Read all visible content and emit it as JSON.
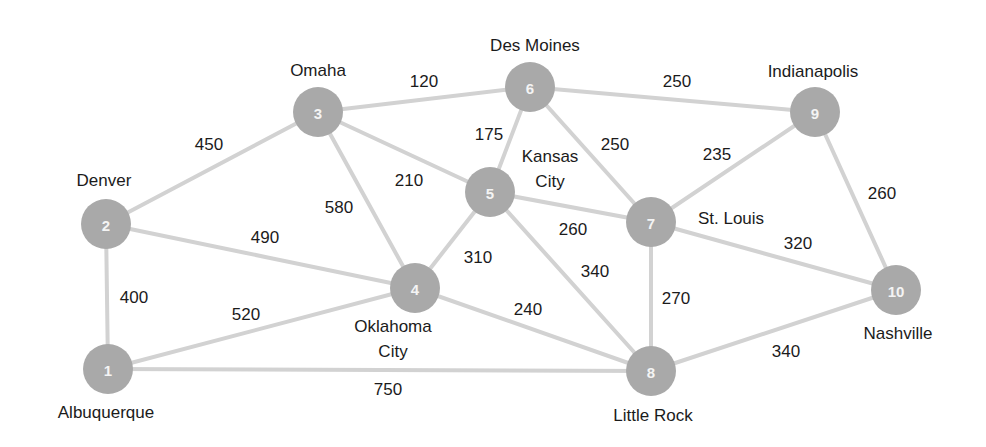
{
  "diagram": {
    "type": "weighted-undirected-graph",
    "colors": {
      "node_fill": "#a9a9a9",
      "node_number": "#f4f4f4",
      "edge": "#d2d2d2",
      "text": "#1b1b1b",
      "background": "#ffffff"
    },
    "nodes": [
      {
        "id": 1,
        "num": "1",
        "city": [
          "Albuquerque"
        ],
        "x": 108,
        "y": 369,
        "label_x": 106,
        "label_y": [
          418
        ]
      },
      {
        "id": 2,
        "num": "2",
        "city": [
          "Denver"
        ],
        "x": 106,
        "y": 224,
        "label_x": 104,
        "label_y": [
          186
        ]
      },
      {
        "id": 3,
        "num": "3",
        "city": [
          "Omaha"
        ],
        "x": 318,
        "y": 112,
        "label_x": 318,
        "label_y": 76
      },
      {
        "id": 4,
        "num": "4",
        "city": [
          "Oklahoma",
          "City"
        ],
        "x": 415,
        "y": 288,
        "label_x": 393,
        "label_y": [
          332,
          357
        ]
      },
      {
        "id": 5,
        "num": "5",
        "city": [
          "Kansas",
          "City"
        ],
        "x": 490,
        "y": 192,
        "label_x": 550,
        "label_y": [
          162,
          187
        ]
      },
      {
        "id": 6,
        "num": "6",
        "city": [
          "Des Moines"
        ],
        "x": 530,
        "y": 87,
        "label_x": 535,
        "label_y": [
          51
        ]
      },
      {
        "id": 7,
        "num": "7",
        "city": [
          "St. Louis"
        ],
        "x": 651,
        "y": 222,
        "label_x": 731,
        "label_y": [
          224
        ]
      },
      {
        "id": 8,
        "num": "8",
        "city": [
          "Little Rock"
        ],
        "x": 651,
        "y": 371,
        "label_x": 653,
        "label_y": [
          421
        ]
      },
      {
        "id": 9,
        "num": "9",
        "city": [
          "Indianapolis"
        ],
        "x": 815,
        "y": 112,
        "label_x": 813,
        "label_y": [
          77
        ]
      },
      {
        "id": 10,
        "num": "10",
        "city": [
          "Nashville"
        ],
        "x": 896,
        "y": 290,
        "label_x": 898,
        "label_y": [
          339
        ]
      }
    ],
    "node_radius": 25,
    "edges": [
      {
        "from": 1,
        "to": 2,
        "weight": "400",
        "lx": 134,
        "ly": 303
      },
      {
        "from": 1,
        "to": 4,
        "weight": "520",
        "lx": 246,
        "ly": 320
      },
      {
        "from": 1,
        "to": 8,
        "weight": "750",
        "lx": 388,
        "ly": 395
      },
      {
        "from": 2,
        "to": 3,
        "weight": "450",
        "lx": 209,
        "ly": 150
      },
      {
        "from": 2,
        "to": 4,
        "weight": "490",
        "lx": 265,
        "ly": 243
      },
      {
        "from": 3,
        "to": 4,
        "weight": "580",
        "lx": 339,
        "ly": 213
      },
      {
        "from": 3,
        "to": 5,
        "weight": "210",
        "lx": 409,
        "ly": 186
      },
      {
        "from": 3,
        "to": 6,
        "weight": "120",
        "lx": 424,
        "ly": 87
      },
      {
        "from": 4,
        "to": 5,
        "weight": "310",
        "lx": 478,
        "ly": 263
      },
      {
        "from": 4,
        "to": 8,
        "weight": "240",
        "lx": 528,
        "ly": 315
      },
      {
        "from": 5,
        "to": 6,
        "weight": "175",
        "lx": 489,
        "ly": 140
      },
      {
        "from": 5,
        "to": 7,
        "weight": "260",
        "lx": 573,
        "ly": 235
      },
      {
        "from": 5,
        "to": 8,
        "weight": "340",
        "lx": 595,
        "ly": 277
      },
      {
        "from": 6,
        "to": 7,
        "weight": "250",
        "lx": 615,
        "ly": 150
      },
      {
        "from": 6,
        "to": 9,
        "weight": "250",
        "lx": 677,
        "ly": 87
      },
      {
        "from": 7,
        "to": 8,
        "weight": "270",
        "lx": 676,
        "ly": 304
      },
      {
        "from": 7,
        "to": 9,
        "weight": "235",
        "lx": 717,
        "ly": 160
      },
      {
        "from": 7,
        "to": 10,
        "weight": "320",
        "lx": 798,
        "ly": 249
      },
      {
        "from": 8,
        "to": 10,
        "weight": "340",
        "lx": 786,
        "ly": 357
      },
      {
        "from": 9,
        "to": 10,
        "weight": "260",
        "lx": 882,
        "ly": 199
      }
    ]
  }
}
